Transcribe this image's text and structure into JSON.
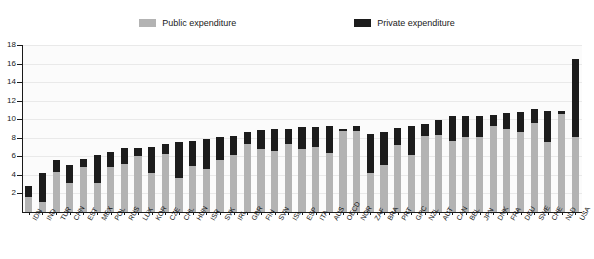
{
  "legend": {
    "items": [
      {
        "label": "Public expenditure",
        "color": "#b3b3b3",
        "name": "public-expenditure"
      },
      {
        "label": "Private expenditure",
        "color": "#1c1c1c",
        "name": "private-expenditure"
      }
    ],
    "position": "top-center"
  },
  "chart_data": {
    "type": "bar",
    "subtype": "stacked-bar",
    "title": "",
    "subtitle": "",
    "xlabel": "",
    "ylabel": "",
    "ylim": [
      0,
      18
    ],
    "yticks": [
      0,
      2,
      4,
      6,
      8,
      10,
      12,
      14,
      16,
      18
    ],
    "ytick_labels": [
      "0",
      "2",
      "4",
      "6",
      "8",
      "10",
      "12",
      "14",
      "16",
      "18"
    ],
    "grid": true,
    "legend_position": "top-center",
    "categories": [
      "IDN",
      "IND",
      "TUR",
      "CHN",
      "EST",
      "MEX",
      "POL",
      "RUS",
      "LUX",
      "KOR",
      "CZE",
      "CHL",
      "HUN",
      "ISR",
      "SVK",
      "IRL",
      "GBR",
      "FIN",
      "SVN",
      "ISL",
      "ESP",
      "ITA",
      "AUS",
      "OECD",
      "NOR",
      "ZAF",
      "BRA",
      "PRT",
      "GRC",
      "NZL",
      "AUT",
      "CAN",
      "BEL",
      "JPN",
      "DNK",
      "FRA",
      "DEU",
      "SWE",
      "CHE",
      "NLD",
      "USA"
    ],
    "series": [
      {
        "name": "Public expenditure",
        "color": "#b3b3b3",
        "values": [
          1.6,
          1.1,
          4.3,
          3.1,
          4.9,
          3.1,
          4.9,
          5.2,
          6.0,
          4.2,
          6.2,
          3.7,
          5.0,
          4.6,
          5.6,
          6.1,
          7.3,
          6.8,
          6.6,
          7.3,
          6.8,
          7.0,
          6.4,
          8.7,
          8.7,
          4.2,
          5.1,
          7.2,
          6.1,
          8.2,
          8.3,
          7.7,
          8.1,
          8.1,
          9.3,
          9.0,
          8.6,
          9.6,
          7.6,
          10.6,
          8.1
        ]
      },
      {
        "name": "Private expenditure",
        "color": "#1c1c1c",
        "values": [
          1.2,
          3.1,
          1.3,
          2.0,
          0.8,
          3.0,
          1.6,
          1.7,
          0.9,
          2.8,
          1.1,
          3.9,
          2.7,
          3.3,
          2.5,
          2.1,
          1.3,
          2.0,
          2.4,
          1.7,
          2.4,
          2.2,
          2.9,
          0.2,
          0.6,
          4.2,
          3.5,
          1.9,
          3.2,
          1.3,
          1.6,
          2.6,
          2.3,
          2.3,
          1.2,
          1.7,
          2.2,
          1.5,
          3.3,
          0.3,
          8.4
        ]
      }
    ],
    "totals": [
      2.8,
      4.2,
      5.6,
      5.1,
      5.7,
      6.1,
      6.5,
      6.9,
      6.9,
      7.0,
      7.3,
      7.6,
      7.7,
      7.9,
      8.1,
      8.2,
      8.6,
      8.8,
      9.0,
      9.0,
      9.2,
      9.2,
      9.3,
      8.9,
      9.3,
      8.4,
      8.6,
      9.1,
      9.3,
      9.5,
      9.9,
      10.3,
      10.4,
      10.4,
      10.5,
      10.7,
      10.8,
      11.1,
      10.9,
      10.9,
      16.5
    ]
  }
}
